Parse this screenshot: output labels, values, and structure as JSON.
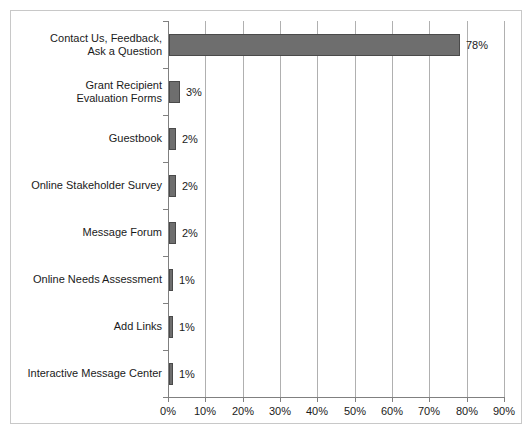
{
  "chart_data": {
    "type": "bar",
    "orientation": "horizontal",
    "title": "",
    "xlabel": "",
    "ylabel": "",
    "categories": [
      "Contact Us, Feedback,\nAsk a Question",
      "Grant Recipient\nEvaluation Forms",
      "Guestbook",
      "Online Stakeholder Survey",
      "Message Forum",
      "Online Needs Assessment",
      "Add Links",
      "Interactive Message Center"
    ],
    "values": [
      78,
      3,
      2,
      2,
      2,
      1,
      1,
      1
    ],
    "value_labels": [
      "78%",
      "3%",
      "2%",
      "2%",
      "2%",
      "1%",
      "1%",
      "1%"
    ],
    "xlim": [
      0,
      90
    ],
    "xticks": [
      0,
      10,
      20,
      30,
      40,
      50,
      60,
      70,
      80,
      90
    ],
    "xticklabels": [
      "0%",
      "10%",
      "20%",
      "30%",
      "40%",
      "50%",
      "60%",
      "70%",
      "80%",
      "90%"
    ],
    "grid": true,
    "grid_axis": "x",
    "legend": false,
    "bar_color": "#6e6e6e",
    "bar_edge_color": "#4a4a4a",
    "gridline_color": "#b0b0b0",
    "axis_color": "#808080",
    "frame_color": "#c8c8c8",
    "background": "#ffffff"
  }
}
